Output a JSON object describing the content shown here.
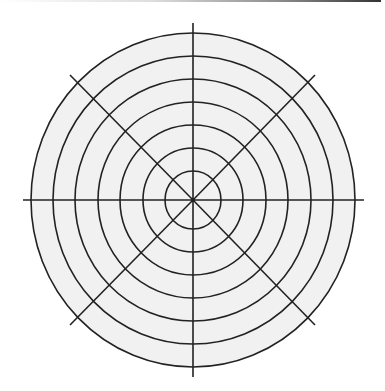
{
  "diagram": {
    "type": "polar-grid",
    "title": "",
    "center": {
      "x": 193,
      "y": 200
    },
    "outer_radius": {
      "rx": 162,
      "ry": 167
    },
    "ring_count": 7,
    "rings": [
      {
        "rx": 28,
        "ry": 29
      },
      {
        "rx": 50,
        "ry": 52
      },
      {
        "rx": 73,
        "ry": 75
      },
      {
        "rx": 95,
        "ry": 98
      },
      {
        "rx": 118,
        "ry": 121
      },
      {
        "rx": 140,
        "ry": 144
      },
      {
        "rx": 162,
        "ry": 167
      }
    ],
    "spokes": [
      {
        "x2": 23,
        "y2": 200
      },
      {
        "x2": 364,
        "y2": 200
      },
      {
        "x2": 193,
        "y2": 23
      },
      {
        "x2": 193,
        "y2": 377
      },
      {
        "x2": 70,
        "y2": 75
      },
      {
        "x2": 315,
        "y2": 75
      },
      {
        "x2": 70,
        "y2": 325
      },
      {
        "x2": 315,
        "y2": 325
      }
    ],
    "colors": {
      "fill": "#f1f1f1",
      "line": "#222222",
      "background": "#ffffff"
    }
  }
}
